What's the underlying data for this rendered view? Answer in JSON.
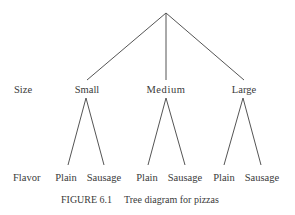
{
  "figure": {
    "caption_number": "FIGURE 6.1",
    "caption_text": "Tree diagram for pizzas"
  },
  "levels": {
    "size_label": "Size",
    "flavor_label": "Flavor"
  },
  "tree": {
    "root": {
      "x": 166,
      "y": 13
    },
    "sizes": [
      {
        "label": "Small",
        "x": 87,
        "apex_x": 86,
        "flavors": [
          {
            "label": "Plain",
            "x": 68
          },
          {
            "label": "Sausage",
            "x": 104
          }
        ]
      },
      {
        "label": "Medium",
        "x": 166,
        "apex_x": 166,
        "flavors": [
          {
            "label": "Plain",
            "x": 148
          },
          {
            "label": "Sausage",
            "x": 185
          }
        ]
      },
      {
        "label": "Large",
        "x": 244,
        "apex_x": 243,
        "flavors": [
          {
            "label": "Plain",
            "x": 224
          },
          {
            "label": "Sausage",
            "x": 261
          }
        ]
      }
    ]
  },
  "colors": {
    "line": "#555555",
    "text": "#3a3a3a",
    "background": "#ffffff"
  }
}
